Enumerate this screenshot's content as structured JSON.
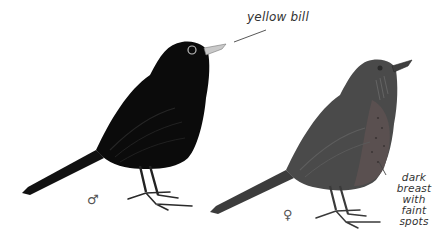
{
  "illustration": {
    "subject": "male and female blackbird",
    "male": {
      "symbol": "♂",
      "body_color": "#0b0b0b",
      "bill_color": "#c9c9c9"
    },
    "female": {
      "symbol": "♀",
      "body_color": "#4a4a4a",
      "breast_color": "#5a5050"
    }
  },
  "annotations": {
    "bill": "yellow bill",
    "breast_line1": "dark",
    "breast_line2": "breast",
    "breast_line3": "with faint",
    "breast_line4": "spots"
  }
}
